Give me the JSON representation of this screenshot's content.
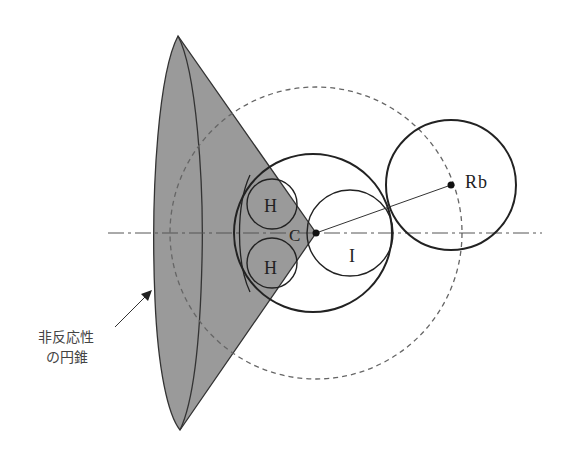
{
  "diagram": {
    "title": "",
    "labels": {
      "H_upper": "H",
      "H_lower": "H",
      "C": "C",
      "I": "I",
      "Rb": "Rb",
      "cone_line1": "非反応性",
      "cone_line2": "の円錐"
    },
    "colors": {
      "cone_fill": "#9a9a9a",
      "stroke": "#222222",
      "dashed": "#666666",
      "background": "#ffffff"
    },
    "elements": [
      {
        "id": "non-reactive-cone",
        "type": "cone",
        "label": "非反応性の円錐"
      },
      {
        "id": "molecule-circle",
        "type": "circle"
      },
      {
        "id": "H-upper",
        "type": "circle",
        "label": "H"
      },
      {
        "id": "H-lower",
        "type": "circle",
        "label": "H"
      },
      {
        "id": "I-atom",
        "type": "circle",
        "label": "I"
      },
      {
        "id": "C-center",
        "type": "point",
        "label": "C"
      },
      {
        "id": "Rb-atom",
        "type": "circle",
        "label": "Rb"
      },
      {
        "id": "dashed-reach-circle",
        "type": "dashed-circle"
      },
      {
        "id": "symmetry-axis",
        "type": "dash-dot-line"
      }
    ]
  }
}
